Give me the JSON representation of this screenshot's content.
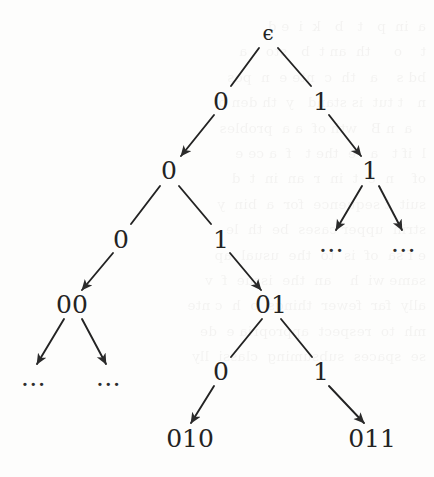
{
  "figure": {
    "kind": "binary-prefix-tree",
    "background_color": "#fdfdfc",
    "ink_color": "#232323",
    "ghost_text": "a  in  p   t   b   k  i  e d\nt    o     th  an t  b   sto    a\nbd s    a   th  c  nte e  n  pos\nn   t tut  is stand   y  th den o\n   a  n B   wth of  a a  probles\nl  if t   a   e  the t   f  a ce e\nof    n  e  t  in  r  an  in  t  d\nsuit  t sequence  for  a  bin  y\nstrin  upper cases  be  th  le\ne f sa  of  is  to  the  usual  ap\nsame wi  h    an  the  issue  f  v\nally  far  fewer  things  o  h  c nte\nmh  to  respect  appropria e  de\nse  spaces  subsuming  classi  lly"
  },
  "nodes": [
    {
      "id": "root",
      "label": "ϵ",
      "x": 268,
      "y": 33,
      "style": "eps"
    },
    {
      "id": "n0",
      "label": "0",
      "x": 221,
      "y": 101,
      "style": "plain"
    },
    {
      "id": "n1",
      "label": "1",
      "x": 321,
      "y": 101,
      "style": "plain"
    },
    {
      "id": "n00",
      "label": "0",
      "x": 169,
      "y": 170,
      "style": "plain"
    },
    {
      "id": "n11",
      "label": "1",
      "x": 370,
      "y": 170,
      "style": "plain"
    },
    {
      "id": "n000",
      "label": "0",
      "x": 121,
      "y": 239,
      "style": "plain"
    },
    {
      "id": "n001",
      "label": "1",
      "x": 221,
      "y": 239,
      "style": "plain"
    },
    {
      "id": "d11a",
      "label": "…",
      "x": 332,
      "y": 243,
      "style": "dots"
    },
    {
      "id": "d11b",
      "label": "…",
      "x": 404,
      "y": 243,
      "style": "dots"
    },
    {
      "id": "n00s",
      "label": "00",
      "x": 72,
      "y": 304,
      "style": "plain"
    },
    {
      "id": "n01s",
      "label": "01",
      "x": 271,
      "y": 304,
      "style": "plain"
    },
    {
      "id": "d00a",
      "label": "…",
      "x": 34,
      "y": 377,
      "style": "dots"
    },
    {
      "id": "d00b",
      "label": "…",
      "x": 109,
      "y": 377,
      "style": "dots"
    },
    {
      "id": "n010",
      "label": "0",
      "x": 221,
      "y": 371,
      "style": "plain"
    },
    {
      "id": "n011",
      "label": "1",
      "x": 321,
      "y": 371,
      "style": "plain"
    },
    {
      "id": "l010",
      "label": "010",
      "x": 190,
      "y": 438,
      "style": "plain"
    },
    {
      "id": "l011",
      "label": "011",
      "x": 372,
      "y": 438,
      "style": "plain"
    }
  ],
  "edges": [
    {
      "from": "root",
      "to": "n0",
      "x1": 259,
      "y1": 48,
      "x2": 231,
      "y2": 86,
      "arrow": false
    },
    {
      "from": "root",
      "to": "n1",
      "x1": 278,
      "y1": 48,
      "x2": 311,
      "y2": 86,
      "arrow": false
    },
    {
      "from": "n0",
      "to": "n00",
      "x1": 214,
      "y1": 115,
      "x2": 181,
      "y2": 156,
      "arrow": true
    },
    {
      "from": "n1",
      "to": "n11",
      "x1": 329,
      "y1": 115,
      "x2": 361,
      "y2": 156,
      "arrow": true
    },
    {
      "from": "n00",
      "to": "n000",
      "x1": 160,
      "y1": 186,
      "x2": 131,
      "y2": 224,
      "arrow": false
    },
    {
      "from": "n00",
      "to": "n001",
      "x1": 179,
      "y1": 186,
      "x2": 211,
      "y2": 224,
      "arrow": false
    },
    {
      "from": "n11",
      "to": "d11a",
      "x1": 362,
      "y1": 186,
      "x2": 336,
      "y2": 230,
      "arrow": true
    },
    {
      "from": "n11",
      "to": "d11b",
      "x1": 379,
      "y1": 186,
      "x2": 402,
      "y2": 230,
      "arrow": true
    },
    {
      "from": "n000",
      "to": "n00s",
      "x1": 113,
      "y1": 253,
      "x2": 82,
      "y2": 290,
      "arrow": true
    },
    {
      "from": "n001",
      "to": "n01s",
      "x1": 230,
      "y1": 253,
      "x2": 261,
      "y2": 290,
      "arrow": true
    },
    {
      "from": "n00s",
      "to": "d00a",
      "x1": 64,
      "y1": 319,
      "x2": 37,
      "y2": 364,
      "arrow": true
    },
    {
      "from": "n00s",
      "to": "d00b",
      "x1": 82,
      "y1": 319,
      "x2": 106,
      "y2": 364,
      "arrow": true
    },
    {
      "from": "n01s",
      "to": "n010",
      "x1": 262,
      "y1": 319,
      "x2": 231,
      "y2": 357,
      "arrow": false
    },
    {
      "from": "n01s",
      "to": "n011",
      "x1": 281,
      "y1": 319,
      "x2": 312,
      "y2": 357,
      "arrow": false
    },
    {
      "from": "n010",
      "to": "l010",
      "x1": 214,
      "y1": 386,
      "x2": 191,
      "y2": 423,
      "arrow": true
    },
    {
      "from": "n011",
      "to": "l011",
      "x1": 329,
      "y1": 386,
      "x2": 364,
      "y2": 423,
      "arrow": true
    }
  ]
}
